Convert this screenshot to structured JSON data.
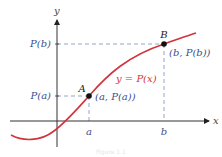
{
  "figure": {
    "axes": {
      "x_label": "x",
      "y_label": "y"
    },
    "ticks": {
      "a_label": "a",
      "b_label": "b",
      "Pa_label": "P(a)",
      "Pb_label": "P(b)"
    },
    "points": [
      {
        "name": "A",
        "coord_label": "(a, P(a))"
      },
      {
        "name": "B",
        "coord_label": "(b, P(b))"
      }
    ],
    "curve": {
      "label": "y = P(x)",
      "color": "#d0343c"
    },
    "colors": {
      "dashed_lines": "#8a9ac4",
      "axes": "#333333",
      "labels": "#3a4f8c"
    },
    "caption": "Figure 1.1"
  }
}
